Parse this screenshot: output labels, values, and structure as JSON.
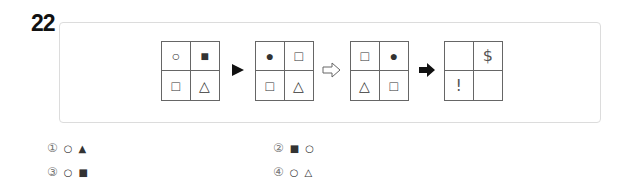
{
  "question": {
    "number": "22",
    "grids": [
      {
        "cells": [
          "○",
          "■",
          "□",
          "△"
        ]
      },
      {
        "cells": [
          "●",
          "□",
          "□",
          "△"
        ]
      },
      {
        "cells": [
          "□",
          "●",
          "△",
          "□"
        ]
      },
      {
        "cells": [
          "",
          "$",
          "!",
          ""
        ]
      }
    ],
    "arrows": [
      {
        "icon": "triangle-right-filled-icon",
        "glyph": "▶"
      },
      {
        "icon": "hollow-arrow-right-icon",
        "glyph": "⇨"
      },
      {
        "icon": "bold-arrow-right-icon",
        "glyph": "➡"
      }
    ]
  },
  "options": [
    {
      "num": "①",
      "symbols": [
        "○",
        "▲"
      ]
    },
    {
      "num": "②",
      "symbols": [
        "■",
        "○"
      ]
    },
    {
      "num": "③",
      "symbols": [
        "○",
        "■"
      ]
    },
    {
      "num": "④",
      "symbols": [
        "○",
        "△"
      ]
    }
  ]
}
